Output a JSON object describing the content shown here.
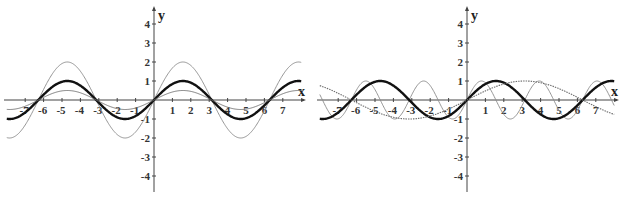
{
  "chart_data": [
    {
      "type": "line",
      "title": "",
      "xlabel": "x",
      "ylabel": "y",
      "xlim": [
        -8,
        8
      ],
      "ylim": [
        -4.5,
        4.6
      ],
      "grid": false,
      "legend": null,
      "x_ticks": [
        -7,
        -6,
        -5,
        -4,
        -3,
        -2,
        -1,
        1,
        2,
        3,
        4,
        5,
        6,
        7
      ],
      "y_ticks": [
        -4,
        -3,
        -2,
        -1,
        1,
        2,
        3,
        4
      ],
      "series": [
        {
          "name": "y = 2 sin x",
          "expr": "2*sin(x)",
          "style": "thin",
          "color": "#8a8a8a"
        },
        {
          "name": "y = sin x",
          "expr": "sin(x)",
          "style": "bold",
          "color": "#111111"
        },
        {
          "name": "y = 0.5 sin x",
          "expr": "0.5*sin(x)",
          "style": "thin",
          "color": "#6e6e6e"
        }
      ]
    },
    {
      "type": "line",
      "title": "",
      "xlabel": "x",
      "ylabel": "y",
      "xlim": [
        -8,
        8
      ],
      "ylim": [
        -4.5,
        4.6
      ],
      "grid": false,
      "legend": null,
      "x_ticks": [
        -7,
        -6,
        -5,
        -4,
        -3,
        -2,
        -1,
        1,
        2,
        3,
        4,
        5,
        6,
        7
      ],
      "y_ticks": [
        -4,
        -3,
        -2,
        -1,
        1,
        2,
        3,
        4
      ],
      "series": [
        {
          "name": "y = sin 2x",
          "expr": "sin(2*x)",
          "style": "thin",
          "color": "#8a8a8a"
        },
        {
          "name": "y = sin x",
          "expr": "sin(x)",
          "style": "bold",
          "color": "#111111"
        },
        {
          "name": "y = sin(x/2)",
          "expr": "sin(x/2)",
          "style": "dotted",
          "color": "#6e6e6e"
        }
      ]
    }
  ],
  "panels": [
    {
      "origin_px": [
        154,
        100
      ],
      "x_unit_px": 18.4,
      "y_unit_px": 19,
      "x_axis_px": [
        4,
        304
      ],
      "y_axis_px": [
        8,
        192
      ]
    },
    {
      "origin_px": [
        154,
        100
      ],
      "x_unit_px": 18.4,
      "y_unit_px": 19,
      "x_axis_px": [
        4,
        304
      ],
      "y_axis_px": [
        8,
        192
      ]
    }
  ]
}
